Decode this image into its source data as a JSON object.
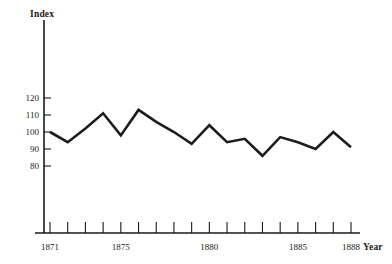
{
  "chart_data": {
    "type": "line",
    "title": "",
    "xlabel": "Year",
    "ylabel": "Index",
    "x": [
      1871,
      1872,
      1873,
      1874,
      1875,
      1876,
      1877,
      1878,
      1879,
      1880,
      1881,
      1882,
      1883,
      1884,
      1885,
      1886,
      1887,
      1888
    ],
    "values": [
      100,
      94,
      102,
      111,
      98,
      113,
      106,
      100,
      93,
      104,
      94,
      96,
      86,
      97,
      94,
      90,
      100,
      91
    ],
    "series": [
      {
        "name": "Index",
        "values": [
          100,
          94,
          102,
          111,
          98,
          113,
          106,
          100,
          93,
          104,
          94,
          96,
          86,
          97,
          94,
          90,
          100,
          91
        ]
      }
    ],
    "ylim": [
      70,
      145
    ],
    "xlim": [
      1870.4,
      1888.6
    ],
    "yticks": [
      80,
      90,
      100,
      110,
      120
    ],
    "ytick_labels": [
      "80",
      "90",
      "100",
      "110",
      "120"
    ],
    "xticks": [
      1871,
      1872,
      1873,
      1874,
      1875,
      1876,
      1877,
      1878,
      1879,
      1880,
      1881,
      1882,
      1883,
      1884,
      1885,
      1886,
      1887,
      1888
    ],
    "xtick_labels_shown": [
      {
        "year": 1871,
        "label": "1871"
      },
      {
        "year": 1875,
        "label": "1875"
      },
      {
        "year": 1880,
        "label": "1880"
      },
      {
        "year": 1885,
        "label": "1885"
      },
      {
        "year": 1888,
        "label": "1888"
      }
    ],
    "grid": false,
    "legend": null,
    "line_color": "#1f1d1b",
    "axis_color": "#1a1a1a",
    "background_color": "#ffffff"
  }
}
